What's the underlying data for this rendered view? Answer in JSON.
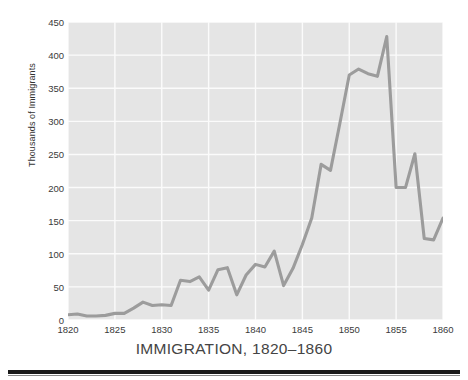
{
  "chart_data": {
    "type": "line",
    "title": "IMMIGRATION, 1820–1860",
    "xlabel": "",
    "ylabel": "Thousands of Immigrants",
    "xlim": [
      1820,
      1860
    ],
    "ylim": [
      0,
      450
    ],
    "grid": true,
    "legend": null,
    "xticks": [
      1820,
      1825,
      1830,
      1835,
      1840,
      1845,
      1850,
      1855,
      1860
    ],
    "yticks": [
      0,
      50,
      100,
      150,
      200,
      250,
      300,
      350,
      400,
      450
    ],
    "x": [
      1820,
      1821,
      1822,
      1823,
      1824,
      1825,
      1826,
      1827,
      1828,
      1829,
      1830,
      1831,
      1832,
      1833,
      1834,
      1835,
      1836,
      1837,
      1838,
      1839,
      1840,
      1841,
      1842,
      1843,
      1844,
      1845,
      1846,
      1847,
      1848,
      1849,
      1850,
      1851,
      1852,
      1853,
      1854,
      1855,
      1856,
      1857,
      1858,
      1859,
      1860
    ],
    "values": [
      8,
      9,
      6,
      6,
      7,
      10,
      10,
      18,
      27,
      22,
      23,
      22,
      60,
      58,
      65,
      45,
      76,
      79,
      38,
      68,
      84,
      80,
      104,
      52,
      78,
      114,
      154,
      235,
      226,
      297,
      370,
      379,
      372,
      368,
      428,
      200,
      200,
      251,
      123,
      121,
      154
    ],
    "peak": {
      "year": 1854,
      "value": 428
    },
    "minimum": {
      "year": 1822,
      "value": 6
    }
  },
  "axes": {
    "y_title": "Thousands of Immigrants"
  },
  "style": {
    "plot_background": "#e5e5e5",
    "gridline_color": "#fbfbfb",
    "line_color": "#9c9c9c",
    "tick_label_color": "#3a3a3a",
    "title_color": "#444444",
    "page_background": "#ffffff",
    "rule_color": "#1a1a1a"
  }
}
